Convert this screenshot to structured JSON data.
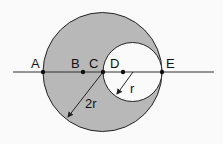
{
  "diagram": {
    "points": [
      {
        "label": "A",
        "x": 43,
        "y": 72
      },
      {
        "label": "B",
        "x": 83,
        "y": 72
      },
      {
        "label": "C",
        "x": 103,
        "y": 72
      },
      {
        "label": "D",
        "x": 123,
        "y": 72
      },
      {
        "label": "E",
        "x": 162,
        "y": 72
      }
    ],
    "big_circle": {
      "cx": 102.5,
      "cy": 72,
      "r": 59.5,
      "radius_label": "2r"
    },
    "small_circle": {
      "cx": 132.5,
      "cy": 72,
      "r": 29.5,
      "radius_label": "r"
    },
    "colors": {
      "shaded": "#b8b8b8",
      "stroke": "#222222",
      "background": "#fafafa"
    }
  },
  "labels": {
    "A": "A",
    "B": "B",
    "C": "C",
    "D": "D",
    "E": "E",
    "big_radius": "2r",
    "small_radius": "r"
  }
}
